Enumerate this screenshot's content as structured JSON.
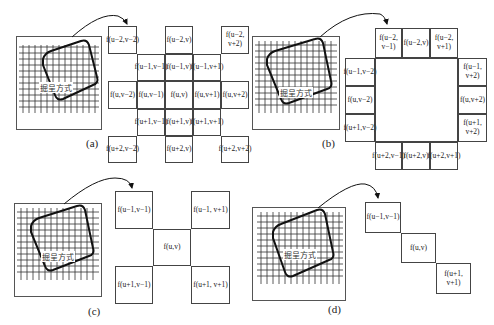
{
  "figure": {
    "rect_label": "掘呈方式",
    "panels": [
      {
        "id": "a",
        "caption": "(a)",
        "cells": [
          {
            "text": "f(u−2,v−2)"
          },
          {
            "text": "f(u−2,v)"
          },
          {
            "text": "f(u−2,\nv+2)"
          },
          {
            "text": "f(u−1,v−1)"
          },
          {
            "text": "f(u−1,v)"
          },
          {
            "text": "f(u−1,v+1)"
          },
          {
            "text": "f(u,v−2)"
          },
          {
            "text": "f(u,v−1)"
          },
          {
            "text": "f(u,v)"
          },
          {
            "text": "f(u,v+1)"
          },
          {
            "text": "f(u,v+2)"
          },
          {
            "text": "f(u+1,v−1)"
          },
          {
            "text": "f(u+1,v)"
          },
          {
            "text": "f(u+1,v+1)"
          },
          {
            "text": "f(u+2,v−2)"
          },
          {
            "text": "f(u+2,v)"
          },
          {
            "text": "f(u+2,v+2)"
          }
        ]
      },
      {
        "id": "b",
        "caption": "(b)",
        "cells": [
          {
            "text": "f(u−2,\nv−1)"
          },
          {
            "text": "f(u−2,v)"
          },
          {
            "text": "f(u−2,\nv+1)"
          },
          {
            "text": "f(u−1,v−2)"
          },
          {
            "text": "f(u−1,\nv+2)"
          },
          {
            "text": "f(u,v−2)"
          },
          {
            "text": "f(u,v+2)"
          },
          {
            "text": "f(u+1,v−2)"
          },
          {
            "text": "f(u+1,\nv+2)"
          },
          {
            "text": "f(u+2,v−1)"
          },
          {
            "text": "f(u+2,v)"
          },
          {
            "text": "f(u+2,v+1)"
          }
        ]
      },
      {
        "id": "c",
        "caption": "(c)",
        "cells": [
          {
            "text": "f(u−1,v−1)"
          },
          {
            "text": "f(u−1, v+1)"
          },
          {
            "text": "f(u,v)"
          },
          {
            "text": "f(u+1,v−1)"
          },
          {
            "text": "f(u+1, v+1)"
          }
        ]
      },
      {
        "id": "d",
        "caption": "(d)",
        "cells": [
          {
            "text": "f(u−1,v−1)"
          },
          {
            "text": "f(u,v)"
          },
          {
            "text": "f(u+1,\nv+1)"
          }
        ]
      }
    ]
  }
}
